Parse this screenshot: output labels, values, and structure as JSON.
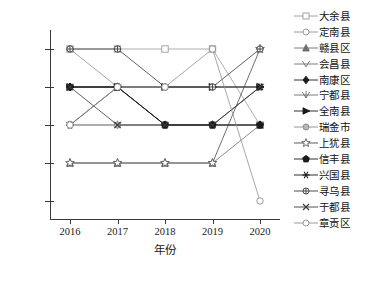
{
  "chart_data": {
    "type": "line",
    "title": "",
    "xlabel": "年份",
    "ylabel": "耕地等级",
    "x": [
      "2016",
      "2017",
      "2018",
      "2019",
      "2020"
    ],
    "categories": [
      "2016",
      "2017",
      "2018",
      "2019",
      "2020"
    ],
    "ylim": [
      0.5,
      5.5
    ],
    "yticks": [
      1,
      2,
      3,
      4,
      5
    ],
    "ytick_labels": [
      "1",
      "2",
      "3",
      "4",
      "5"
    ],
    "grid": false,
    "legend_position": "right",
    "series": [
      {
        "name": "大余县",
        "marker": "square-open",
        "color": "#9a9a9a",
        "values": [
          5,
          5,
          5,
          5,
          3
        ]
      },
      {
        "name": "定南县",
        "marker": "circle-open",
        "color": "#8f8f8f",
        "values": [
          5,
          4,
          4,
          4,
          4
        ]
      },
      {
        "name": "赣县区",
        "marker": "triangle-up",
        "color": "#6e6e6e",
        "values": [
          2,
          2,
          2,
          2,
          3
        ]
      },
      {
        "name": "会昌县",
        "marker": "caret-down",
        "color": "#6e6e6e",
        "values": [
          4,
          4,
          4,
          4,
          4
        ]
      },
      {
        "name": "南康区",
        "marker": "diamond-filled",
        "color": "#1a1a1a",
        "values": [
          4,
          4,
          3,
          3,
          3
        ]
      },
      {
        "name": "宁都县",
        "marker": "tri-down",
        "color": "#6e6e6e",
        "values": [
          3,
          3,
          3,
          3,
          3
        ]
      },
      {
        "name": "全南县",
        "marker": "triangle-right",
        "color": "#1a1a1a",
        "values": [
          4,
          4,
          4,
          4,
          4
        ]
      },
      {
        "name": "瑞金市",
        "marker": "circle-gray",
        "color": "#8a8a8a",
        "values": [
          3,
          3,
          3,
          3,
          3
        ]
      },
      {
        "name": "上犹县",
        "marker": "star",
        "color": "#4a4a4a",
        "values": [
          2,
          2,
          2,
          2,
          5
        ]
      },
      {
        "name": "信丰县",
        "marker": "pentagon",
        "color": "#1a1a1a",
        "values": [
          4,
          4,
          3,
          3,
          3
        ]
      },
      {
        "name": "兴国县",
        "marker": "asterisk",
        "color": "#1a1a1a",
        "values": [
          3,
          4,
          3,
          3,
          4
        ]
      },
      {
        "name": "寻乌县",
        "marker": "circle-plus",
        "color": "#3a3a3a",
        "values": [
          5,
          5,
          4,
          4,
          5
        ]
      },
      {
        "name": "于都县",
        "marker": "cross-x",
        "color": "#3a3a3a",
        "values": [
          4,
          3,
          3,
          3,
          4
        ]
      },
      {
        "name": "章贡区",
        "marker": "circle-open2",
        "color": "#8f8f8f",
        "values": [
          3,
          4,
          4,
          5,
          1
        ]
      }
    ]
  },
  "legend": {
    "items": [
      {
        "label": "大余县"
      },
      {
        "label": "定南县"
      },
      {
        "label": "赣县区"
      },
      {
        "label": "会昌县"
      },
      {
        "label": "南康区"
      },
      {
        "label": "宁都县"
      },
      {
        "label": "全南县"
      },
      {
        "label": "瑞金市"
      },
      {
        "label": "上犹县"
      },
      {
        "label": "信丰县"
      },
      {
        "label": "兴国县"
      },
      {
        "label": "寻乌县"
      },
      {
        "label": "于都县"
      },
      {
        "label": "章贡区"
      }
    ]
  }
}
